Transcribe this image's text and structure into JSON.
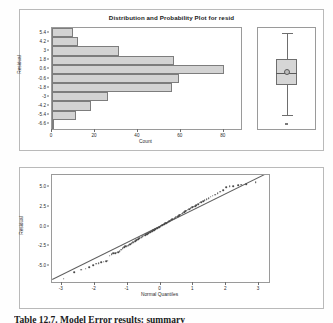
{
  "figure": {
    "caption": "Table 12.7. Model Error results: summary"
  },
  "top_panel": {
    "title": "Distribution and Probability Plot for resid",
    "histogram": {
      "y_axis_title": "Residual",
      "x_axis_title": "Count",
      "y_tick_labels": [
        "5.4",
        "4.2",
        "3",
        "1.8",
        "0.6",
        "-0.6",
        "-1.8",
        "-3",
        "-4.2",
        "-5.4",
        "-6.6"
      ],
      "x_tick_labels": [
        "0",
        "20",
        "40",
        "60",
        "80"
      ]
    },
    "boxplot": {
      "name": "residual-boxplot"
    }
  },
  "bottom_panel": {
    "qq_plot": {
      "y_axis_title": "Residual",
      "x_axis_title": "Normal Quantiles",
      "y_tick_labels": [
        "5.0",
        "2.5",
        "0.0",
        "-2.5",
        "-5.0"
      ],
      "x_tick_labels": [
        "-3",
        "-2",
        "-1",
        "0",
        "1",
        "2",
        "3"
      ]
    }
  },
  "chart_data": [
    {
      "type": "bar",
      "orientation": "horizontal",
      "title": "Distribution and Probability Plot for resid",
      "xlabel": "Count",
      "ylabel": "Residual",
      "xlim": [
        0,
        88
      ],
      "grid": false,
      "categories": [
        "5.4",
        "4.2",
        "3",
        "1.8",
        "0.6",
        "-0.6",
        "-1.8",
        "-3",
        "-4.2",
        "-5.4",
        "-6.6"
      ],
      "values": [
        10,
        12,
        31,
        57,
        80,
        59,
        56,
        26,
        18,
        11,
        1
      ],
      "x_ticks": [
        0,
        20,
        40,
        60,
        80
      ]
    },
    {
      "type": "boxplot",
      "title": "Residual box plot",
      "ylabel": "Residual",
      "ylim": [
        -7.2,
        6.0
      ],
      "whisker_low": -5.4,
      "q1": -1.5,
      "median": 0.15,
      "mean": 0.25,
      "q3": 2.0,
      "whisker_high": 5.4,
      "outliers": [
        -6.6
      ]
    },
    {
      "type": "scatter",
      "title": "Normal probability plot of residuals",
      "xlabel": "Normal Quantiles",
      "ylabel": "Residual",
      "xlim": [
        -3.3,
        3.3
      ],
      "ylim": [
        -7.0,
        6.5
      ],
      "x_ticks": [
        -3,
        -2,
        -1,
        0,
        1,
        2,
        3
      ],
      "y_ticks": [
        5.0,
        2.5,
        0.0,
        -2.5,
        -5.0
      ],
      "grid": false,
      "reference_line": {
        "intercept": 0.1,
        "slope": 2.05
      },
      "points": [
        [
          -2.95,
          -6.6
        ],
        [
          -2.62,
          -5.75
        ],
        [
          -2.42,
          -5.45
        ],
        [
          -2.28,
          -5.3
        ],
        [
          -2.16,
          -5.1
        ],
        [
          -2.05,
          -4.9
        ],
        [
          -1.96,
          -4.7
        ],
        [
          -1.88,
          -4.6
        ],
        [
          -1.8,
          -4.5
        ],
        [
          -1.73,
          -4.45
        ],
        [
          -1.66,
          -4.4
        ],
        [
          -1.6,
          -4.3
        ],
        [
          -1.54,
          -3.7
        ],
        [
          -1.49,
          -3.5
        ],
        [
          -1.43,
          -3.4
        ],
        [
          -1.38,
          -3.35
        ],
        [
          -1.33,
          -3.3
        ],
        [
          -1.29,
          -3.25
        ],
        [
          -1.24,
          -3.1
        ],
        [
          -1.2,
          -2.9
        ],
        [
          -1.15,
          -2.75
        ],
        [
          -1.11,
          -2.6
        ],
        [
          -1.07,
          -2.5
        ],
        [
          -1.03,
          -2.45
        ],
        [
          -0.99,
          -2.4
        ],
        [
          -0.95,
          -2.3
        ],
        [
          -0.92,
          -2.2
        ],
        [
          -0.88,
          -2.1
        ],
        [
          -0.84,
          -2.0
        ],
        [
          -0.81,
          -1.95
        ],
        [
          -0.77,
          -1.85
        ],
        [
          -0.74,
          -1.75
        ],
        [
          -0.7,
          -1.65
        ],
        [
          -0.67,
          -1.6
        ],
        [
          -0.64,
          -1.5
        ],
        [
          -0.6,
          -1.4
        ],
        [
          -0.57,
          -1.35
        ],
        [
          -0.54,
          -1.25
        ],
        [
          -0.51,
          -1.15
        ],
        [
          -0.47,
          -1.1
        ],
        [
          -0.44,
          -1.0
        ],
        [
          -0.41,
          -0.95
        ],
        [
          -0.38,
          -0.85
        ],
        [
          -0.35,
          -0.8
        ],
        [
          -0.32,
          -0.7
        ],
        [
          -0.29,
          -0.65
        ],
        [
          -0.26,
          -0.6
        ],
        [
          -0.22,
          -0.5
        ],
        [
          -0.19,
          -0.45
        ],
        [
          -0.16,
          -0.35
        ],
        [
          -0.13,
          -0.3
        ],
        [
          -0.1,
          -0.2
        ],
        [
          -0.07,
          -0.15
        ],
        [
          -0.04,
          -0.05
        ],
        [
          -0.01,
          0.0
        ],
        [
          0.02,
          0.1
        ],
        [
          0.05,
          0.15
        ],
        [
          0.08,
          0.25
        ],
        [
          0.11,
          0.3
        ],
        [
          0.14,
          0.4
        ],
        [
          0.17,
          0.45
        ],
        [
          0.2,
          0.5
        ],
        [
          0.23,
          0.6
        ],
        [
          0.27,
          0.65
        ],
        [
          0.3,
          0.75
        ],
        [
          0.33,
          0.85
        ],
        [
          0.36,
          0.9
        ],
        [
          0.4,
          1.0
        ],
        [
          0.43,
          1.05
        ],
        [
          0.46,
          1.15
        ],
        [
          0.5,
          1.25
        ],
        [
          0.53,
          1.3
        ],
        [
          0.57,
          1.4
        ],
        [
          0.6,
          1.5
        ],
        [
          0.64,
          1.6
        ],
        [
          0.68,
          1.7
        ],
        [
          0.72,
          1.8
        ],
        [
          0.75,
          1.9
        ],
        [
          0.79,
          2.0
        ],
        [
          0.83,
          2.1
        ],
        [
          0.87,
          2.2
        ],
        [
          0.92,
          2.3
        ],
        [
          0.96,
          2.4
        ],
        [
          1.0,
          2.5
        ],
        [
          1.05,
          2.6
        ],
        [
          1.09,
          2.7
        ],
        [
          1.14,
          2.85
        ],
        [
          1.19,
          3.0
        ],
        [
          1.24,
          3.1
        ],
        [
          1.29,
          3.2
        ],
        [
          1.35,
          3.35
        ],
        [
          1.4,
          3.45
        ],
        [
          1.46,
          3.6
        ],
        [
          1.53,
          3.75
        ],
        [
          1.59,
          3.9
        ],
        [
          1.66,
          4.0
        ],
        [
          1.74,
          4.2
        ],
        [
          1.82,
          4.4
        ],
        [
          1.9,
          4.6
        ],
        [
          2.0,
          4.95
        ],
        [
          2.1,
          5.05
        ],
        [
          2.22,
          5.1
        ],
        [
          2.36,
          5.2
        ],
        [
          2.45,
          5.3
        ],
        [
          2.6,
          5.35
        ],
        [
          2.9,
          5.6
        ]
      ]
    }
  ]
}
